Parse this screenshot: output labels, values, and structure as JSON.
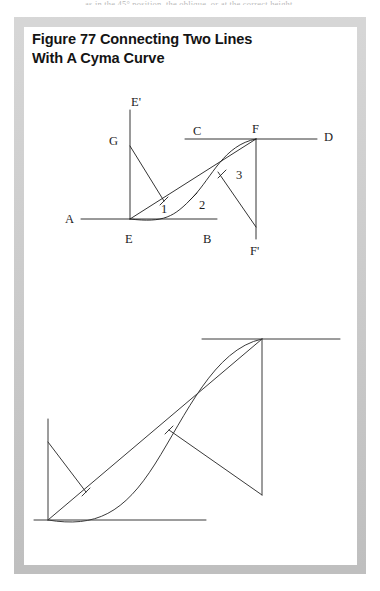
{
  "page": {
    "top_cut_text": "as in the 45° position, the oblique, or at the correct height."
  },
  "figure": {
    "title": "Figure 77  Connecting Two Lines\nWith A Cyma Curve",
    "frame_color": "#c9c9c9",
    "panel_color": "#ffffff",
    "ink_color": "#1d1d1d"
  },
  "diagram_upper": {
    "name": "labeled-cyma-curve-construction",
    "labels": [
      {
        "text": "E'",
        "x": 107,
        "y": 79
      },
      {
        "text": "G",
        "x": 85,
        "y": 118
      },
      {
        "text": "C",
        "x": 169,
        "y": 112
      },
      {
        "text": "F",
        "x": 228,
        "y": 108
      },
      {
        "text": "D",
        "x": 302,
        "y": 114
      },
      {
        "text": "1",
        "x": 137,
        "y": 183
      },
      {
        "text": "2",
        "x": 178,
        "y": 182
      },
      {
        "text": "3",
        "x": 213,
        "y": 153
      },
      {
        "text": "A",
        "x": 43,
        "y": 198
      },
      {
        "text": "E",
        "x": 102,
        "y": 216
      },
      {
        "text": "B",
        "x": 180,
        "y": 216
      },
      {
        "text": "F'",
        "x": 227,
        "y": 219
      }
    ],
    "lines": {
      "AB": {
        "x1": 57,
        "y1": 192,
        "x2": 193,
        "y2": 192
      },
      "EE'": {
        "x1": 106,
        "y1": 83,
        "x2": 106,
        "y2": 192
      },
      "CD": {
        "x1": 161,
        "y1": 112,
        "x2": 293,
        "y2": 112
      },
      "FF'": {
        "x1": 232,
        "y1": 112,
        "x2": 232,
        "y2": 212
      },
      "EF": {
        "x1": 106,
        "y1": 192,
        "x2": 232,
        "y2": 112
      },
      "G_to_1": {
        "x1": 106,
        "y1": 119,
        "x2": 140,
        "y2": 174
      },
      "3_to_Fprime": {
        "x1": 194,
        "y1": 145,
        "x2": 232,
        "y2": 200
      }
    },
    "ticks": [
      {
        "name": "tick-1",
        "x": 140,
        "y": 174
      },
      {
        "name": "tick-2",
        "x": 169,
        "y": 170
      },
      {
        "name": "tick-3",
        "x": 198,
        "y": 147
      }
    ],
    "curve": "cyma-s-curve-from-E-to-F"
  },
  "diagram_lower": {
    "name": "unlabeled-enlarged-cyma-curve-construction",
    "lines": {
      "base": {
        "x1": 10,
        "y1": 493,
        "x2": 182,
        "y2": 493
      },
      "vert_left": {
        "x1": 24,
        "y1": 392,
        "x2": 24,
        "y2": 493
      },
      "top": {
        "x1": 178,
        "y1": 312,
        "x2": 316,
        "y2": 312
      },
      "vert_right": {
        "x1": 238,
        "y1": 312,
        "x2": 238,
        "y2": 468
      },
      "diagonal": {
        "x1": 24,
        "y1": 493,
        "x2": 238,
        "y2": 312
      },
      "g_line": {
        "x1": 24,
        "y1": 415,
        "x2": 62,
        "y2": 465
      },
      "f_line": {
        "x1": 145,
        "y1": 403,
        "x2": 238,
        "y2": 468
      }
    },
    "curve": "cyma-s-curve-large"
  }
}
